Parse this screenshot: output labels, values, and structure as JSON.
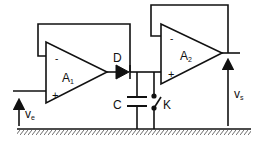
{
  "diagram": {
    "type": "circuit",
    "components": {
      "opamp1": {
        "label": "A",
        "subscript": "1",
        "minus": "-",
        "plus": "+"
      },
      "opamp2": {
        "label": "A",
        "subscript": "2",
        "minus": "-",
        "plus": "+"
      },
      "diode": {
        "label": "D"
      },
      "capacitor": {
        "label": "C"
      },
      "switch": {
        "label": "K"
      }
    },
    "signals": {
      "input": {
        "label": "v",
        "subscript": "e"
      },
      "output": {
        "label": "v",
        "subscript": "s"
      }
    },
    "colors": {
      "line": "#111111",
      "background": "#ffffff"
    }
  }
}
